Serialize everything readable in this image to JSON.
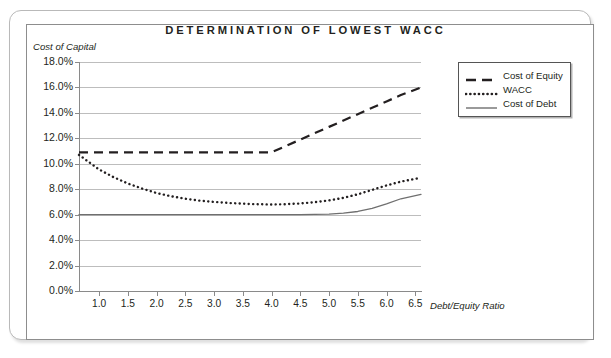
{
  "figure": {
    "title": "DETERMINATION OF LOWEST WACC"
  },
  "legend": {
    "position": "top-right",
    "items": [
      {
        "label": "Cost of Equity",
        "style": "dashed",
        "color": "#231f20",
        "icon": "dashed-line-icon"
      },
      {
        "label": "WACC",
        "style": "dotted",
        "color": "#231f20",
        "icon": "dotted-line-icon"
      },
      {
        "label": "Cost of Debt",
        "style": "solid",
        "color": "#6f6f6f",
        "icon": "solid-line-icon"
      }
    ]
  },
  "axes": {
    "y_title": "Cost of Capital",
    "x_title": "Debt/Equity Ratio",
    "y_ticks": [
      "18.0%",
      "16.0%",
      "14.0%",
      "12.0%",
      "10.0%",
      "8.0%",
      "6.0%",
      "4.0%",
      "2.0%",
      "0.0%"
    ],
    "x_ticks": [
      "1.0",
      "1.5",
      "2.0",
      "2.5",
      "3.0",
      "3.5",
      "4.0",
      "4.5",
      "5.0",
      "5.5",
      "6.0",
      "6.5"
    ]
  },
  "chart_data": {
    "type": "line",
    "title": "DETERMINATION OF LOWEST WACC",
    "xlabel": "Debt/Equity Ratio",
    "ylabel": "Cost of Capital",
    "xlim": [
      0.65,
      6.6
    ],
    "ylim": [
      0.0,
      18.0
    ],
    "y_unit": "percent",
    "grid": true,
    "legend_position": "top-right",
    "x": [
      0.65,
      1.0,
      1.25,
      1.5,
      1.75,
      2.0,
      2.25,
      2.5,
      2.75,
      3.0,
      3.25,
      3.5,
      3.75,
      4.0,
      4.25,
      4.5,
      4.75,
      5.0,
      5.25,
      5.5,
      5.75,
      6.0,
      6.25,
      6.6
    ],
    "series": [
      {
        "name": "Cost of Equity",
        "style": "dashed",
        "color": "#231f20",
        "values": [
          10.9,
          10.9,
          10.9,
          10.9,
          10.9,
          10.9,
          10.9,
          10.9,
          10.9,
          10.9,
          10.9,
          10.9,
          10.9,
          10.9,
          11.4,
          11.9,
          12.4,
          12.9,
          13.4,
          13.9,
          14.4,
          14.9,
          15.4,
          16.0
        ]
      },
      {
        "name": "WACC",
        "style": "dotted",
        "color": "#231f20",
        "values": [
          10.7,
          9.55,
          8.95,
          8.45,
          8.05,
          7.7,
          7.45,
          7.25,
          7.1,
          7.0,
          6.92,
          6.86,
          6.82,
          6.8,
          6.82,
          6.88,
          6.98,
          7.12,
          7.32,
          7.6,
          7.95,
          8.3,
          8.6,
          8.9
        ]
      },
      {
        "name": "Cost of Debt",
        "style": "solid",
        "color": "#6f6f6f",
        "values": [
          6.0,
          6.0,
          6.0,
          6.0,
          6.0,
          6.0,
          6.0,
          6.0,
          6.0,
          6.0,
          6.0,
          6.0,
          6.0,
          6.0,
          6.0,
          6.0,
          6.02,
          6.05,
          6.12,
          6.25,
          6.5,
          6.85,
          7.25,
          7.6
        ]
      }
    ]
  }
}
